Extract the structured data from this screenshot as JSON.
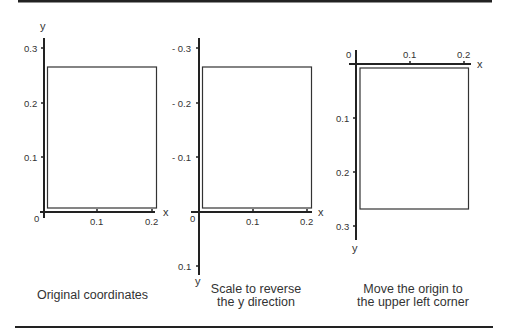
{
  "panels": [
    {
      "caption": "Original coordinates",
      "axes": {
        "x_label": "x",
        "y_label": "y",
        "origin_label": "0"
      },
      "x_ticks": [
        "0.1",
        "0.2"
      ],
      "y_ticks": [
        "0.3",
        "0.2",
        "0.1"
      ]
    },
    {
      "caption_line1": "Scale to reverse",
      "caption_line2": "the y direction",
      "axes": {
        "x_label": "x",
        "y_label": "y",
        "origin_label": "0"
      },
      "x_ticks": [
        "0.1",
        "0.2"
      ],
      "y_ticks": [
        "- 0.3",
        "- 0.2",
        "- 0.1",
        "0.1"
      ]
    },
    {
      "caption_line1": "Move the origin to",
      "caption_line2": "the upper left corner",
      "axes": {
        "x_label": "x",
        "y_label": "y",
        "origin_label": "0"
      },
      "x_ticks": [
        "0.1",
        "0.2"
      ],
      "y_ticks": [
        "0.1",
        "0.2",
        "0.3"
      ]
    }
  ],
  "stray_x_label": "x"
}
